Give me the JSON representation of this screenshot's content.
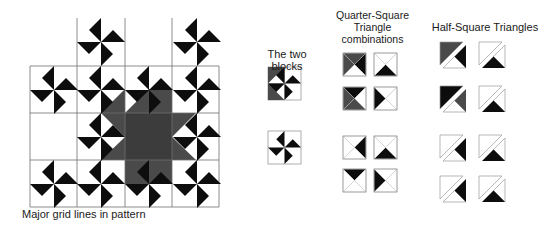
{
  "colors": {
    "black": "#0d0d0d",
    "gray": "#4a4a4a",
    "white": "#ffffff",
    "grid": "#6e6e6e",
    "outline": "#9a9a9a"
  },
  "main_pattern": {
    "caption": "Major grid lines in pattern",
    "grid_x": [
      30,
      77,
      125,
      172,
      219
    ],
    "grid_y": [
      18,
      66,
      113,
      160,
      207
    ],
    "vlines": [
      {
        "x": 77,
        "y1": 18,
        "y2": 207
      },
      {
        "x": 125,
        "y1": 18,
        "y2": 207
      },
      {
        "x": 172,
        "y1": 18,
        "y2": 207
      },
      {
        "x": 30,
        "y1": 66,
        "y2": 207
      },
      {
        "x": 219,
        "y1": 66,
        "y2": 207
      }
    ],
    "hlines": [
      {
        "y": 66,
        "x1": 30,
        "x2": 219
      },
      {
        "y": 113,
        "x1": 30,
        "x2": 219
      },
      {
        "y": 160,
        "x1": 30,
        "x2": 219
      },
      {
        "y": 207,
        "x1": 30,
        "x2": 219
      }
    ],
    "pinwheel_size": 12,
    "pinwheels": [
      [
        101,
        42
      ],
      [
        197,
        42
      ],
      [
        54,
        90
      ],
      [
        101,
        90
      ],
      [
        149,
        90
      ],
      [
        197,
        90
      ],
      [
        101,
        137
      ],
      [
        197,
        137
      ],
      [
        54,
        184
      ],
      [
        101,
        184
      ],
      [
        149,
        184
      ],
      [
        197,
        184
      ]
    ],
    "star": {
      "square": [
        125,
        113,
        47,
        47
      ],
      "points": "101,113 125,89 125,113 149,89 172,89 172,113 196,113 172,137 196,160 172,160 172,184 149,184 125,184 125,160 101,160 125,137"
    }
  },
  "two_blocks": {
    "title": "The two blocks",
    "blocks": [
      {
        "x": 268,
        "y": 67,
        "size": 33,
        "shaded_left": true
      },
      {
        "x": 268,
        "y": 131,
        "size": 33,
        "shaded_left": false
      }
    ]
  },
  "qst": {
    "title_lines": [
      "Quarter-Square",
      "Triangle",
      "combinations"
    ],
    "blocks": [
      {
        "x": 343,
        "y": 53,
        "size": 23,
        "tri": {
          "top": "gray",
          "left": "gray",
          "right": "black",
          "bottom": "white"
        }
      },
      {
        "x": 374,
        "y": 53,
        "size": 23,
        "tri": {
          "top": "white",
          "left": "white",
          "right": "white",
          "bottom": "black"
        }
      },
      {
        "x": 343,
        "y": 87,
        "size": 23,
        "tri": {
          "top": "black",
          "left": "gray",
          "right": "white",
          "bottom": "gray"
        }
      },
      {
        "x": 374,
        "y": 87,
        "size": 23,
        "tri": {
          "top": "white",
          "left": "black",
          "right": "white",
          "bottom": "white"
        }
      },
      {
        "x": 343,
        "y": 136,
        "size": 23,
        "tri": {
          "top": "white",
          "left": "white",
          "right": "black",
          "bottom": "white"
        }
      },
      {
        "x": 374,
        "y": 136,
        "size": 23,
        "tri": {
          "top": "white",
          "left": "white",
          "right": "white",
          "bottom": "black"
        }
      },
      {
        "x": 343,
        "y": 169,
        "size": 23,
        "tri": {
          "top": "black",
          "left": "white",
          "right": "white",
          "bottom": "white"
        }
      },
      {
        "x": 374,
        "y": 169,
        "size": 23,
        "tri": {
          "top": "white",
          "left": "black",
          "right": "white",
          "bottom": "white"
        }
      }
    ]
  },
  "hst": {
    "title": "Half-Square Triangles",
    "blocks": [
      {
        "x": 440,
        "y": 42,
        "size": 26,
        "upper": "gray",
        "lower": "black",
        "lower_side": "right"
      },
      {
        "x": 479,
        "y": 42,
        "size": 26,
        "upper": "white",
        "lower": "black",
        "lower_side": "bottom"
      },
      {
        "x": 440,
        "y": 86,
        "size": 26,
        "upper": "black",
        "lower": "gray",
        "lower_side": "top"
      },
      {
        "x": 479,
        "y": 86,
        "size": 26,
        "upper": "white",
        "lower": "black",
        "lower_side": "left"
      },
      {
        "x": 440,
        "y": 135,
        "size": 26,
        "upper": "white",
        "lower": "black",
        "lower_side": "right"
      },
      {
        "x": 479,
        "y": 135,
        "size": 26,
        "upper": "white",
        "lower": "black",
        "lower_side": "bottom"
      },
      {
        "x": 440,
        "y": 176,
        "size": 26,
        "upper": "white",
        "lower": "black",
        "lower_side": "top"
      },
      {
        "x": 479,
        "y": 176,
        "size": 26,
        "upper": "white",
        "lower": "black",
        "lower_side": "left"
      }
    ]
  }
}
